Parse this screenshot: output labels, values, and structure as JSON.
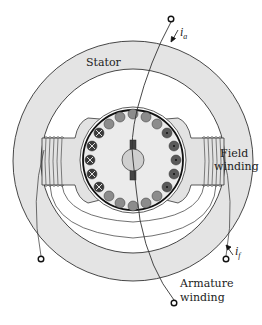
{
  "diagram": {
    "labels": {
      "stator": "Stator",
      "field_winding_line1": "Field",
      "field_winding_line2": "winding",
      "armature_winding_line1": "Armature",
      "armature_winding_line2": "winding",
      "armature_current_symbol": "i",
      "armature_current_subscript": "a",
      "field_current_symbol": "i",
      "field_current_subscript": "f"
    },
    "colors": {
      "stator_fill": "#e4e4e4",
      "rotor_fill": "#ebebeb",
      "pole_fill": "#e2e2e2",
      "slot_neutral": "#8c8c8c",
      "slot_conductor_in": "#3a3a3a",
      "slot_conductor_out": "#5a5a5a",
      "shaft_fill": "#cfcfcf",
      "commutator_fill": "#444444",
      "line": "#222222"
    },
    "components": [
      "stator-ring",
      "left-pole",
      "right-pole",
      "field-coil-left",
      "field-coil-right",
      "rotor",
      "rotor-slots",
      "shaft",
      "brushes",
      "armature-lead",
      "field-leads",
      "terminals"
    ]
  }
}
